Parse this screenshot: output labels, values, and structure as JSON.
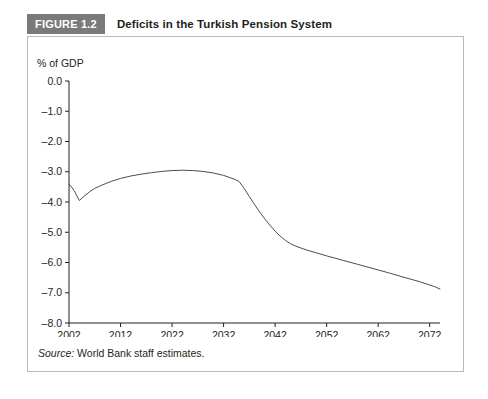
{
  "figure": {
    "tag": "FIGURE 1.2",
    "title": "Deficits in the Turkish Pension System",
    "source_label": "Source:",
    "source_text": " World Bank staff estimates."
  },
  "colors": {
    "tag_background": "#7a7a7a",
    "tag_text": "#ffffff",
    "panel_border": "#b9b9b9",
    "axis": "#231f20",
    "line": "#4d4d4d",
    "background": "#ffffff"
  },
  "chart_data": {
    "type": "line",
    "title": "Deficits in the Turkish Pension System",
    "xlabel": "Years",
    "ylabel": "% of GDP",
    "xlim": [
      2002,
      2074
    ],
    "ylim": [
      -8.0,
      0.0
    ],
    "grid": false,
    "legend": "none",
    "xticks": [
      2002,
      2012,
      2022,
      2032,
      2042,
      2052,
      2062,
      2072
    ],
    "xtick_labels": [
      "2002",
      "2012",
      "2022",
      "2032",
      "2042",
      "2052",
      "2062",
      "2072"
    ],
    "yticks": [
      0.0,
      -1.0,
      -2.0,
      -3.0,
      -4.0,
      -5.0,
      -6.0,
      -7.0,
      -8.0
    ],
    "ytick_labels": [
      "0.0",
      "–1.0",
      "–2.0",
      "–3.0",
      "–4.0",
      "–5.0",
      "–6.0",
      "–7.0",
      "–8.0"
    ],
    "series": [
      {
        "name": "Pension system deficit",
        "x": [
          2002,
          2003,
          2004,
          2005,
          2006,
          2007,
          2008,
          2010,
          2012,
          2014,
          2016,
          2018,
          2020,
          2022,
          2024,
          2026,
          2028,
          2030,
          2032,
          2034,
          2035,
          2036,
          2037,
          2038,
          2039,
          2040,
          2041,
          2042,
          2043,
          2044,
          2045,
          2046,
          2048,
          2050,
          2052,
          2055,
          2058,
          2061,
          2064,
          2067,
          2070,
          2073,
          2074
        ],
        "values": [
          -3.4,
          -3.62,
          -3.95,
          -3.8,
          -3.66,
          -3.55,
          -3.47,
          -3.33,
          -3.22,
          -3.14,
          -3.08,
          -3.03,
          -2.99,
          -2.96,
          -2.95,
          -2.96,
          -2.99,
          -3.04,
          -3.12,
          -3.24,
          -3.32,
          -3.55,
          -3.82,
          -4.08,
          -4.33,
          -4.56,
          -4.77,
          -4.96,
          -5.13,
          -5.27,
          -5.38,
          -5.46,
          -5.58,
          -5.68,
          -5.78,
          -5.92,
          -6.06,
          -6.2,
          -6.34,
          -6.49,
          -6.63,
          -6.8,
          -6.88
        ]
      }
    ]
  }
}
